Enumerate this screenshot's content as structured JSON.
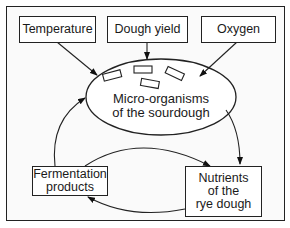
{
  "diagram": {
    "inputs": [
      {
        "id": "temperature",
        "label": "Temperature"
      },
      {
        "id": "dough-yield",
        "label": "Dough yield"
      },
      {
        "id": "oxygen",
        "label": "Oxygen"
      }
    ],
    "center": {
      "label": "Micro-organisms\nof the sourdough"
    },
    "cycle": [
      {
        "id": "fermentation-products",
        "label": "Fermentation\nproducts"
      },
      {
        "id": "nutrients",
        "label": "Nutrients\nof the\nrye dough"
      }
    ],
    "edges": [
      {
        "from": "Temperature",
        "to": "Micro-organisms of the sourdough"
      },
      {
        "from": "Dough yield",
        "to": "Micro-organisms of the sourdough"
      },
      {
        "from": "Oxygen",
        "to": "Micro-organisms of the sourdough"
      },
      {
        "from": "Micro-organisms of the sourdough",
        "to": "Nutrients of the rye dough"
      },
      {
        "from": "Fermentation products",
        "to": "Micro-organisms of the sourdough"
      },
      {
        "from": "Fermentation products",
        "to": "Nutrients of the rye dough"
      },
      {
        "from": "Nutrients of the rye dough",
        "to": "Fermentation products"
      }
    ]
  }
}
